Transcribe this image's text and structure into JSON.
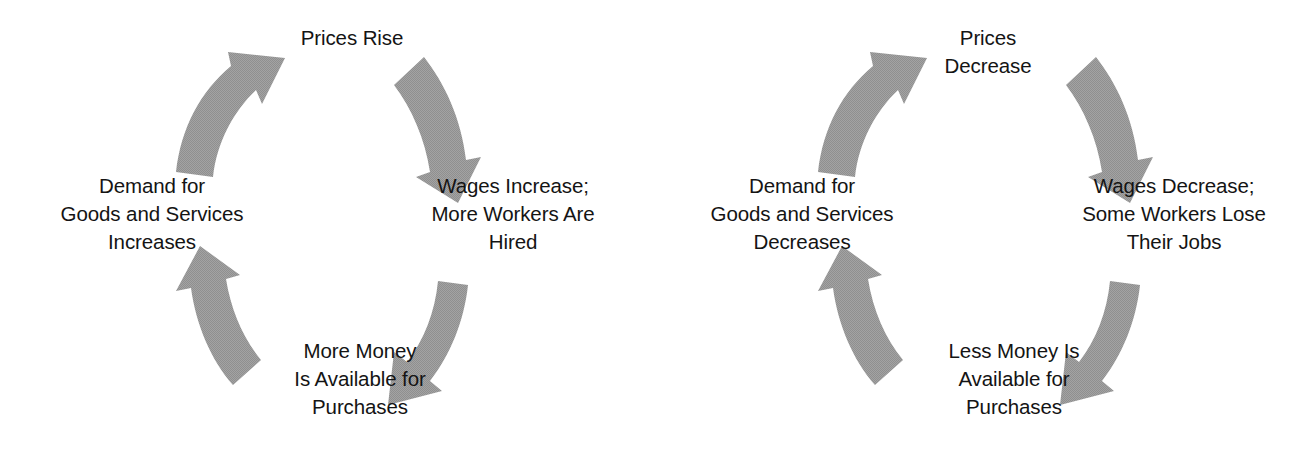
{
  "page": {
    "background_color": "#ffffff",
    "arrow_color": "#9e9e9e",
    "text_color": "#141414"
  },
  "diagrams": [
    {
      "id": "inflation-cycle",
      "title": "Inflation Cycle",
      "direction": "clockwise",
      "nodes": {
        "top": "Prices Rise",
        "right": "Wages Increase;\nMore Workers Are\nHired",
        "bottom": "More Money\nIs Available for\nPurchases",
        "left": "Demand for\nGoods and Services\nIncreases"
      },
      "arrows": [
        {
          "name": "arrow-left-to-top",
          "from": "left",
          "to": "top",
          "points": "up-right"
        },
        {
          "name": "arrow-top-to-right",
          "from": "top",
          "to": "right",
          "points": "down-right"
        },
        {
          "name": "arrow-right-to-bottom",
          "from": "right",
          "to": "bottom",
          "points": "down-left"
        },
        {
          "name": "arrow-bottom-to-left",
          "from": "bottom",
          "to": "left",
          "points": "up-left"
        }
      ]
    },
    {
      "id": "deflation-cycle",
      "title": "Deflation Cycle",
      "direction": "clockwise",
      "nodes": {
        "top": "Prices\nDecrease",
        "right": "Wages Decrease;\nSome Workers Lose\nTheir Jobs",
        "bottom": "Less Money Is\nAvailable for\nPurchases",
        "left": "Demand for\nGoods and Services\nDecreases"
      },
      "arrows": [
        {
          "name": "arrow-left-to-top",
          "from": "left",
          "to": "top",
          "points": "up-right"
        },
        {
          "name": "arrow-top-to-right",
          "from": "top",
          "to": "right",
          "points": "down-right"
        },
        {
          "name": "arrow-right-to-bottom",
          "from": "right",
          "to": "bottom",
          "points": "down-left"
        },
        {
          "name": "arrow-bottom-to-left",
          "from": "bottom",
          "to": "left",
          "points": "up-left"
        }
      ]
    }
  ]
}
